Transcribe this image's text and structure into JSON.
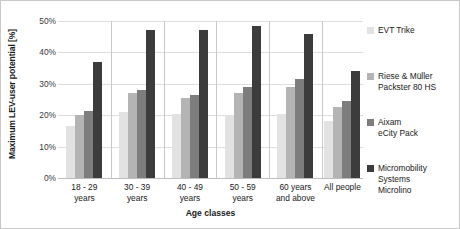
{
  "chart_data": {
    "type": "bar",
    "title": "",
    "xlabel": "Age classes",
    "ylabel": "Maximum LEV-user potential [%]",
    "ylim": [
      0,
      50
    ],
    "yticks": [
      "0%",
      "10%",
      "20%",
      "30%",
      "40%",
      "50%"
    ],
    "ytick_values": [
      0,
      10,
      20,
      30,
      40,
      50
    ],
    "grid": true,
    "legend_position": "right",
    "categories": [
      "18 - 29\nyears",
      "30 - 39\nyears",
      "40 - 49\nyears",
      "50 - 59\nyears",
      "60 years\nand above",
      "All people"
    ],
    "category_lines": [
      [
        "18 - 29",
        "years"
      ],
      [
        "30 - 39",
        "years"
      ],
      [
        "40 - 49",
        "years"
      ],
      [
        "50 - 59",
        "years"
      ],
      [
        "60 years",
        "and above"
      ],
      [
        "All people",
        ""
      ]
    ],
    "series": [
      {
        "name": "EVT Trike",
        "label_lines": [
          "EVT Trike"
        ],
        "color": "#e2e2e2",
        "values": [
          16.5,
          21.0,
          20.5,
          20.0,
          20.5,
          18.0
        ]
      },
      {
        "name": "Riese & Müller Packster 80 HS",
        "label_lines": [
          "Riese & Müller",
          "Packster 80 HS"
        ],
        "color": "#b4b4b4",
        "values": [
          20.0,
          27.0,
          25.5,
          27.0,
          29.0,
          22.5
        ]
      },
      {
        "name": "Aixam eCity Pack",
        "label_lines": [
          "Aixam",
          "eCity Pack"
        ],
        "color": "#7d7d7d",
        "values": [
          21.5,
          28.0,
          26.5,
          29.0,
          31.5,
          24.5
        ]
      },
      {
        "name": "Micromobility Systems Microlino",
        "label_lines": [
          "Micromobility",
          "Systems",
          "Microlino"
        ],
        "color": "#3c3c3c",
        "values": [
          37.0,
          47.0,
          47.0,
          48.5,
          46.0,
          34.0
        ]
      }
    ]
  },
  "legend": {
    "items": [
      {
        "label": "EVT Trike",
        "color": "#e2e2e2",
        "top": 6
      },
      {
        "label": "Riese & Müller\nPackster 80 HS",
        "color": "#b4b4b4",
        "top": 52
      },
      {
        "label": "Aixam\neCity Pack",
        "color": "#7d7d7d",
        "top": 98
      },
      {
        "label": "Micromobility\nSystems\nMicrolino",
        "color": "#3c3c3c",
        "top": 144
      }
    ]
  }
}
